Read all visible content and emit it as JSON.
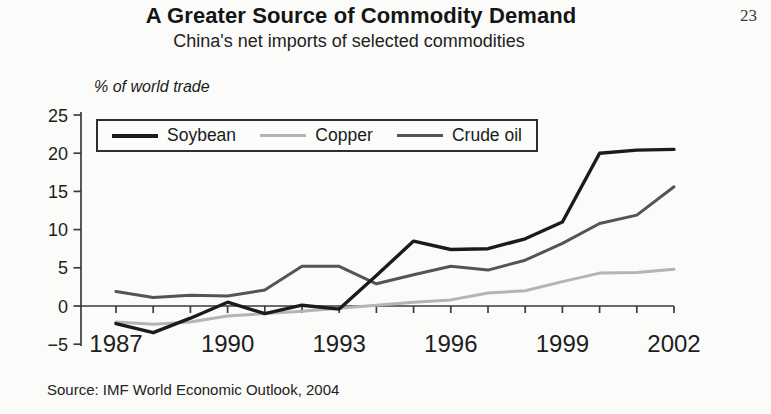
{
  "page": {
    "number": "23"
  },
  "chart_data": {
    "type": "line",
    "title": "A Greater Source of Commodity Demand",
    "subtitle": "China's net imports of selected commodities",
    "ylabel": "% of world trade",
    "xlabel": "",
    "x": [
      1987,
      1988,
      1989,
      1990,
      1991,
      1992,
      1993,
      1994,
      1995,
      1996,
      1997,
      1998,
      1999,
      2000,
      2001,
      2002
    ],
    "x_tick_labels": [
      1987,
      1990,
      1993,
      1996,
      1999,
      2002
    ],
    "y_ticks": [
      25,
      20,
      15,
      10,
      5,
      0,
      -5
    ],
    "ylim": [
      -5,
      25
    ],
    "grid": false,
    "legend_position": "top-left-inside",
    "series": [
      {
        "name": "Soybean",
        "color": "#1b1b1b",
        "values": [
          -2.3,
          -3.5,
          -1.6,
          0.5,
          -1.0,
          0.1,
          -0.4,
          4.0,
          8.5,
          7.4,
          7.5,
          8.8,
          11.0,
          20.0,
          20.4,
          20.5
        ]
      },
      {
        "name": "Copper",
        "color": "#b4b4b4",
        "values": [
          -2.1,
          -2.4,
          -2.1,
          -1.3,
          -1.0,
          -0.7,
          -0.3,
          0.1,
          0.5,
          0.8,
          1.7,
          2.0,
          3.2,
          4.3,
          4.4,
          4.8
        ]
      },
      {
        "name": "Crude oil",
        "color": "#545454",
        "values": [
          1.9,
          1.1,
          1.4,
          1.3,
          2.1,
          5.2,
          5.2,
          2.9,
          4.1,
          5.2,
          4.7,
          6.0,
          8.2,
          10.8,
          11.9,
          15.6
        ]
      }
    ],
    "source": "Source: IMF World Economic Outlook, 2004",
    "axis_color": "#3b3b3b"
  }
}
